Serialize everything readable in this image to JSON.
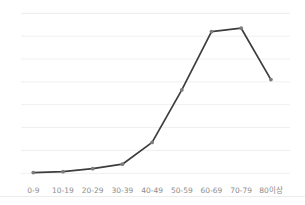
{
  "chart_data": {
    "type": "line",
    "title": "",
    "xlabel": "",
    "ylabel": "",
    "categories": [
      "0-9",
      "10-19",
      "20-29",
      "30-39",
      "40-49",
      "50-59",
      "60-69",
      "70-79",
      "80이상"
    ],
    "values": [
      0.03,
      0.07,
      0.2,
      0.4,
      1.35,
      3.65,
      6.2,
      6.35,
      4.1
    ],
    "ylim": [
      0,
      7
    ],
    "grid": true,
    "gridline_count": 8,
    "y_axis_labels_visible": false,
    "legend": "none",
    "colors": {
      "line": "#3d3d3d",
      "marker": "#7d7d7d",
      "gridline": "#efefef",
      "top_gridline": "#ebebeb",
      "axis_label": "#8c8c8c",
      "bottom_border": "#ededed",
      "background": "#ffffff"
    }
  }
}
